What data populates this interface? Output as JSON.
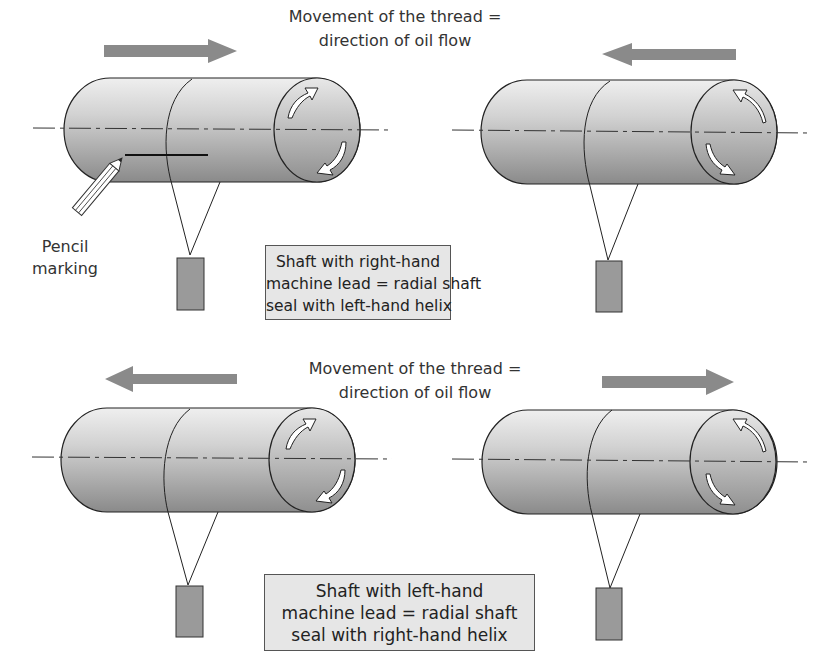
{
  "top_section": {
    "caption_line1": "Movement of the thread =",
    "caption_line2": "direction of oil flow",
    "box_line1": "Shaft with right-hand",
    "box_line2": "machine lead = radial shaft",
    "box_line3": "seal with left-hand helix",
    "left_arrow_direction": "right",
    "right_arrow_direction": "left"
  },
  "bottom_section": {
    "caption_line1": "Movement of the thread =",
    "caption_line2": "direction of oil flow",
    "box_line1": "Shaft with left-hand",
    "box_line2": "machine lead = radial shaft",
    "box_line3": "seal with right-hand helix",
    "left_arrow_direction": "left",
    "right_arrow_direction": "right"
  },
  "pencil": {
    "label_line1": "Pencil",
    "label_line2": "marking"
  },
  "colors": {
    "arrow": "#8a8a8a",
    "shaft_light": "#ececec",
    "shaft_dark": "#8c8c8c",
    "box_fill": "#e6e6e6",
    "weight_fill": "#9a9a9a"
  }
}
